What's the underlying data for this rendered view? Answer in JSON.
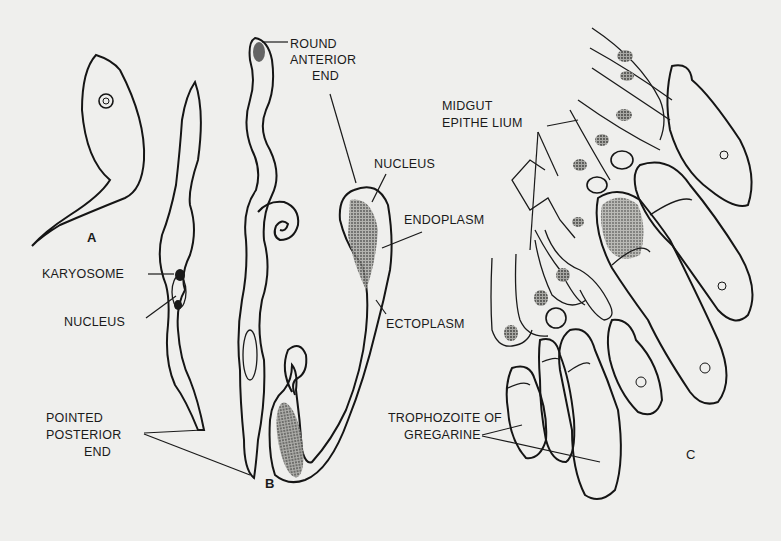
{
  "figure": {
    "panels": {
      "A": "A",
      "B": "B",
      "C": "C"
    },
    "labels": {
      "round_anterior_end": [
        "ROUND",
        "ANTERIOR",
        "END"
      ],
      "nucleus_b": "NUCLEUS",
      "endoplasm": "ENDOPLASM",
      "ectoplasm": "ECTOPLASM",
      "karyosome": "KARYOSOME",
      "nucleus_a": "NUCLEUS",
      "pointed_posterior_end": [
        "POINTED",
        "POSTERIOR",
        "END"
      ],
      "midgut_epithelium": [
        "MIDGUT",
        "EPITHE LIUM"
      ],
      "trophozoite": [
        "TROPHOZOITE OF",
        "GREGARINE"
      ]
    },
    "colors": {
      "background": "#efefed",
      "ink": "#151515",
      "stipple": "#8a8a86"
    }
  }
}
